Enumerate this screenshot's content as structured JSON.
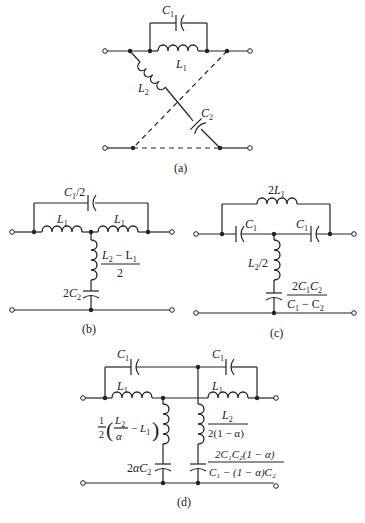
{
  "figure": {
    "panels": [
      {
        "id": "a",
        "caption": "(a)",
        "labels": {
          "c1": "C",
          "c1_sub": "1",
          "l1": "L",
          "l1_sub": "1",
          "l2": "L",
          "l2_sub": "2",
          "c2": "C",
          "c2_sub": "2"
        }
      },
      {
        "id": "b",
        "caption": "(b)",
        "labels": {
          "top_cap": "C",
          "top_cap_sub": "1",
          "top_cap_suffix": "/2",
          "l_left": "L",
          "l_left_sub": "1",
          "l_right": "L",
          "l_right_sub": "1",
          "shunt_l_num": "L",
          "shunt_l_num_sub": "2",
          "shunt_l_num_mid": " − L",
          "shunt_l_num_sub2": "1",
          "shunt_l_den": "2",
          "shunt_c": "2C",
          "shunt_c_sub": "2"
        }
      },
      {
        "id": "c",
        "caption": "(c)",
        "labels": {
          "top_l": "2L",
          "top_l_sub": "1",
          "c_left": "C",
          "c_left_sub": "1",
          "c_right": "C",
          "c_right_sub": "1",
          "shunt_l": "L",
          "shunt_l_sub": "2",
          "shunt_l_suffix": "/2",
          "shunt_c_num": "2C",
          "shunt_c_num_sub1": "1",
          "shunt_c_num_mid": "C",
          "shunt_c_num_sub2": "2",
          "shunt_c_den": "C",
          "shunt_c_den_sub1": "1",
          "shunt_c_den_mid": " − C",
          "shunt_c_den_sub2": "2"
        }
      },
      {
        "id": "d",
        "caption": "(d)",
        "labels": {
          "c_left": "C",
          "c_left_sub": "1",
          "c_right": "C",
          "c_right_sub": "1",
          "l_left": "L",
          "l_left_sub": "1",
          "l_right": "L",
          "l_right_sub": "1",
          "shunt1_l": "1/2 (L2/α − L1)",
          "shunt1_c": "2αC",
          "shunt1_c_sub": "2",
          "shunt2_l_num": "L",
          "shunt2_l_num_sub": "2",
          "shunt2_l_den": "2(1 − α)",
          "shunt2_c_num": "2C₁C₂(1 − α)",
          "shunt2_c_den": "C₁ − (1 − α)C₂"
        }
      }
    ]
  }
}
